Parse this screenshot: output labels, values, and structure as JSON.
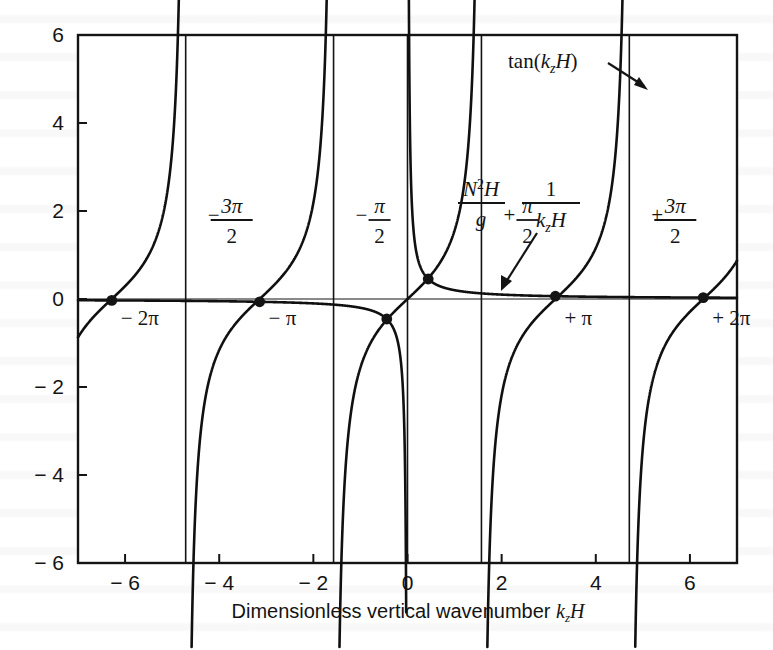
{
  "figure": {
    "kind": "mathematical-plot",
    "xlabel_text": "Dimensionless vertical wavenumber",
    "xlabel_math": "k",
    "xlabel_math_sub": "z",
    "xlabel_math_tail": "H"
  },
  "chart_data": {
    "type": "line",
    "title": "",
    "xlabel": "Dimensionless vertical wavenumber k_zH",
    "ylabel": "",
    "xlim": [
      -7,
      7
    ],
    "ylim": [
      -6,
      6
    ],
    "xticks": [
      -6,
      -4,
      -2,
      0,
      2,
      4,
      6
    ],
    "xticklabels": [
      "-6",
      "-4",
      "-2",
      "0",
      "2",
      "4",
      "6"
    ],
    "yticks": [
      -6,
      -4,
      -2,
      0,
      2,
      4,
      6
    ],
    "yticklabels": [
      "-6",
      "-4",
      "-2",
      "0",
      "2",
      "4",
      "6"
    ],
    "grid": false,
    "legend": "none",
    "series": [
      {
        "name": "tan(k_zH)",
        "kind": "tangent",
        "expression": "y = tan(x)",
        "asymptotes_x": [
          -4.712389,
          -1.570796,
          1.570796,
          4.712389
        ],
        "branch_centers_x": [
          -6.283185,
          -3.141593,
          0.0,
          3.141593,
          6.283185
        ]
      },
      {
        "name": "N^2H/g * 1/(k_zH)",
        "kind": "hyperbola",
        "expression": "y = A / x",
        "A": 0.2,
        "asymptotes_x": [
          0.0
        ]
      }
    ],
    "intersections": [
      {
        "x": -6.283185,
        "y": -0.031831
      },
      {
        "x": -3.141593,
        "y": -0.063662
      },
      {
        "x": -0.44,
        "y": -0.454545
      },
      {
        "x": 0.44,
        "y": 0.454545
      },
      {
        "x": 3.141593,
        "y": 0.063662
      },
      {
        "x": 6.283185,
        "y": 0.031831
      }
    ],
    "vertical_asymptote_lines_x": [
      -4.712389,
      -1.570796,
      0.0,
      1.570796,
      4.712389
    ],
    "zero_line_y": 0
  },
  "annotations": {
    "tan_label": {
      "text_prefix": "tan(",
      "text_math": "k",
      "text_sub": "z",
      "text_tail": "H",
      "text_suffix": ")",
      "arrow": "arrow-down-right"
    },
    "hyperbola_label": {
      "frac1_num_N": "N",
      "frac1_num_exp": "2",
      "frac1_num_H": "H",
      "frac1_den": "g",
      "frac2_num": "1",
      "frac2_den_k": "k",
      "frac2_den_sub": "z",
      "frac2_den_H": "H",
      "arrow": "arrow-down-left"
    }
  },
  "asymptote_labels": [
    {
      "id": "neg-3pi-over-2",
      "sign": "−",
      "numerator": "3π",
      "denominator": "2",
      "at_x": -4.712389
    },
    {
      "id": "neg-pi-over-2",
      "sign": "−",
      "numerator": "π",
      "denominator": "2",
      "at_x": -1.570796
    },
    {
      "id": "pos-pi-over-2",
      "sign": "+",
      "numerator": "π",
      "denominator": "2",
      "at_x": 1.570796
    },
    {
      "id": "pos-3pi-over-2",
      "sign": "+",
      "numerator": "3π",
      "denominator": "2",
      "at_x": 4.712389
    }
  ],
  "root_labels": [
    {
      "id": "neg-2pi",
      "text": "− 2π",
      "at_x": -6.283185
    },
    {
      "id": "neg-pi",
      "text": "− π",
      "at_x": -3.141593
    },
    {
      "id": "pos-pi",
      "text": "+ π",
      "at_x": 3.141593
    },
    {
      "id": "pos-2pi",
      "text": "+ 2π",
      "at_x": 6.283185
    }
  ],
  "colors": {
    "ink": "#141414",
    "curve": "#101010",
    "background": "#ffffff"
  }
}
